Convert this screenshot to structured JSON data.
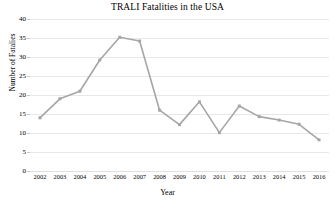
{
  "chart_data": {
    "type": "line",
    "title": "TRALI Fatalities in the USA",
    "xlabel": "Year",
    "ylabel": "Number of Fatalies",
    "categories": [
      "2002",
      "2003",
      "2004",
      "2005",
      "2006",
      "2007",
      "2008",
      "2009",
      "2010",
      "2011",
      "2012",
      "2013",
      "2014",
      "2015",
      "2016"
    ],
    "values": [
      14,
      19,
      21,
      29.2,
      35.2,
      34.2,
      16,
      12.2,
      18.2,
      10.1,
      17.1,
      14.3,
      13.4,
      12.3,
      8.2
    ],
    "ylim": [
      0,
      40
    ],
    "ytick_labels": [
      "40",
      "35",
      "30",
      "25",
      "20",
      "15",
      "10",
      "5",
      "0"
    ],
    "ytick_values": [
      40,
      35,
      30,
      25,
      20,
      15,
      10,
      5,
      0
    ],
    "grid": "horizontal",
    "legend": "none",
    "series_color": "#A6A6A6",
    "grid_color": "#E8E8E8",
    "marker": "square",
    "text_color": "#000000"
  }
}
